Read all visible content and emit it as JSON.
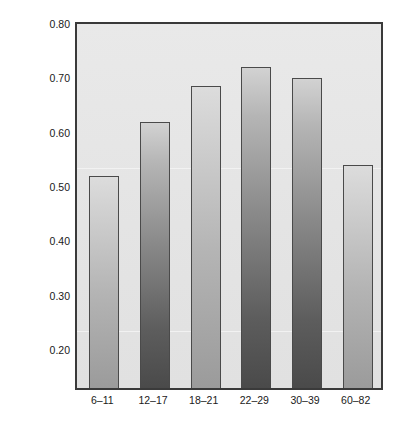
{
  "chart_data": {
    "type": "bar",
    "title": "",
    "subtitle": "",
    "xlabel": "",
    "ylabel": "Self-Esteem Test-Retest Correlation",
    "categories": [
      "6–11",
      "12–17",
      "18–21",
      "22–29",
      "30–39",
      "60–82"
    ],
    "values": [
      0.52,
      0.62,
      0.685,
      0.72,
      0.7,
      0.54
    ],
    "ylim": [
      0.13,
      0.8
    ],
    "ytick_labels": [
      "0.80",
      "0.70",
      "0.60",
      "0.50",
      "0.40",
      "0.30",
      "0.20"
    ],
    "ytick_values": [
      0.8,
      0.7,
      0.6,
      0.5,
      0.4,
      0.3,
      0.2
    ],
    "grid": false,
    "legend": null,
    "series": [
      {
        "name": "Self-Esteem Test-Retest Correlation",
        "values": [
          0.52,
          0.62,
          0.685,
          0.72,
          0.7,
          0.54
        ]
      }
    ],
    "bar_shades": [
      "light",
      "dark",
      "light",
      "dark",
      "dark",
      "light"
    ],
    "annotations": []
  },
  "style": {
    "plot_background": "#e6e6e6",
    "axis_color": "#3a3a3a",
    "bar_border_color": "#4a4a4a",
    "bar_light_top": "#dcdcdc",
    "bar_light_bottom": "#9b9b9b",
    "bar_dark_top": "#d2d2d2",
    "bar_dark_bottom": "#4a4a4a",
    "text_color": "#1a1a1a",
    "page_background": "#ffffff"
  }
}
